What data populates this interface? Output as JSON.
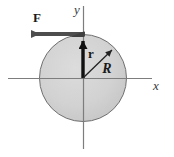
{
  "figure": {
    "background_color": "#ffffff",
    "width": 174,
    "height": 157
  },
  "disk": {
    "name": "shaded-disk",
    "center_x": 83,
    "center_y": 78,
    "radius": 44,
    "fill_color": "#cfcfcf",
    "stroke_color": "#6b6b6b"
  },
  "axes": {
    "color": "#7a7a7a",
    "x_axis": {
      "label": "x",
      "label_x": 157,
      "label_y": 89,
      "y": 78,
      "x_start": 8,
      "x_end": 152
    },
    "y_axis": {
      "label": "y",
      "label_x": 77,
      "label_y": 13,
      "x": 83,
      "y_start": 6,
      "y_end": 149
    }
  },
  "vectors": [
    {
      "name": "force-vector",
      "label": "F",
      "label_x": 37,
      "label_y": 21,
      "color": "#4d4d4d",
      "tail_x": 85,
      "tail_y": 34,
      "tip_x": 22,
      "tip_y": 34,
      "direction": "left"
    },
    {
      "name": "position-vector",
      "label": "r",
      "label_x": 90,
      "label_y": 57,
      "color": "#111111",
      "tail_x": 83,
      "tail_y": 78,
      "tip_x": 83,
      "tip_y": 35,
      "direction": "up"
    },
    {
      "name": "radius-vector",
      "label": "R",
      "label_x": 106,
      "label_y": 72,
      "color": "#222222",
      "tail_x": 83,
      "tail_y": 78,
      "tip_x": 115,
      "tip_y": 47,
      "direction": "up-right"
    }
  ],
  "chart_data": {
    "type": "diagram",
    "elements": [
      {
        "kind": "circle",
        "label": "R",
        "center": [
          0,
          0
        ],
        "radius": 44,
        "fill": "#cfcfcf"
      },
      {
        "kind": "axis",
        "label": "x",
        "orientation": "horizontal"
      },
      {
        "kind": "axis",
        "label": "y",
        "orientation": "vertical"
      },
      {
        "kind": "vector",
        "label": "F",
        "from": [
          0,
          43
        ],
        "to": [
          -63,
          43
        ]
      },
      {
        "kind": "vector",
        "label": "r",
        "from": [
          0,
          0
        ],
        "to": [
          0,
          43
        ]
      },
      {
        "kind": "vector",
        "label": "R",
        "from": [
          0,
          0
        ],
        "to": [
          32,
          31
        ]
      }
    ],
    "xlabel": "x",
    "ylabel": "y",
    "legend": []
  }
}
